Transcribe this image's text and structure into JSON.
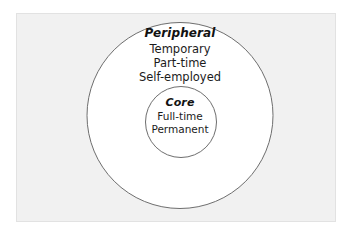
{
  "figure": {
    "background_color": "#ffffff",
    "panel_color": "#f1f1f1",
    "panel_border_color": "#e2e2e2",
    "circle_stroke_color": "#6e6e6e",
    "circle_fill_color": "#ffffff",
    "text_color": "#1b1b1b"
  },
  "diagram": {
    "type": "concentric-circles",
    "outer": {
      "heading": "Peripheral",
      "items": [
        "Temporary",
        "Part-time",
        "Self-employed"
      ]
    },
    "inner": {
      "heading": "Core",
      "items": [
        "Full-time",
        "Permanent"
      ]
    }
  }
}
